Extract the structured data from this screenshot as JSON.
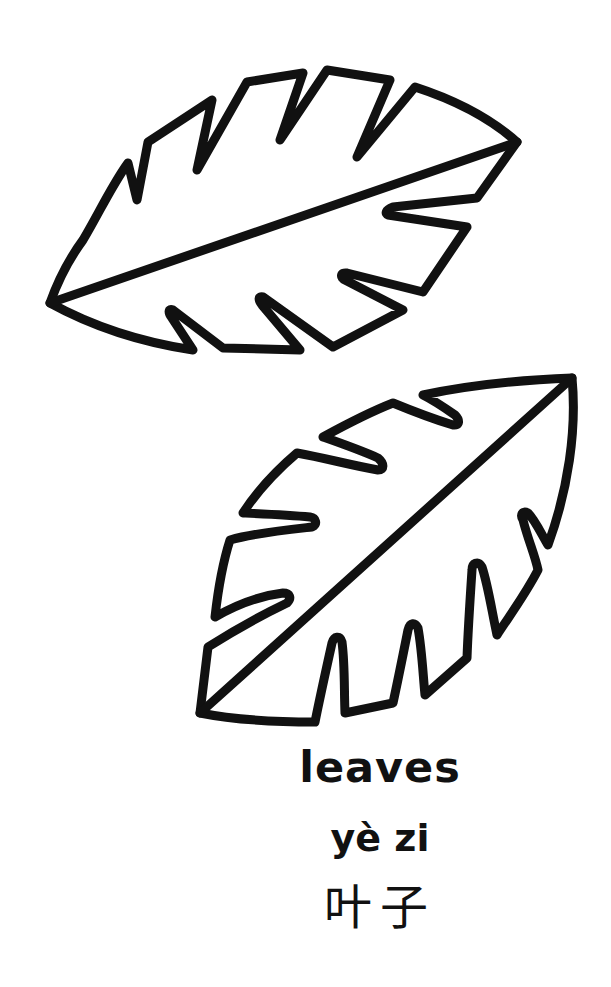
{
  "page": {
    "type": "coloring-page",
    "subject": "leaves"
  },
  "illustration": {
    "leaves": [
      {
        "name": "top-leaf",
        "style": "outline"
      },
      {
        "name": "bottom-leaf",
        "style": "outline"
      }
    ],
    "line_color": "#111111",
    "fill_color": "#ffffff"
  },
  "caption": {
    "english": "leaves",
    "pinyin": "yè zi",
    "chinese": "叶子"
  }
}
